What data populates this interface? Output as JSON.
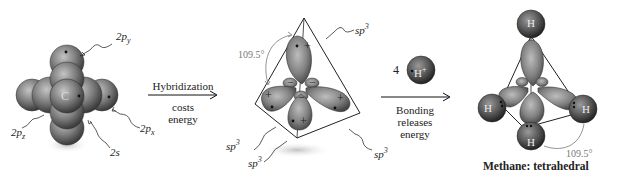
{
  "panels": {
    "carbon": {
      "atom_symbol": "C",
      "labels": {
        "p_y": {
          "base": "2p",
          "sub": "y"
        },
        "p_x": {
          "base": "2p",
          "sub": "x"
        },
        "p_z": {
          "base": "2p",
          "sub": "z"
        },
        "s": "2s"
      }
    },
    "arrow1": {
      "top": "Hybridization",
      "bottom_line1": "costs",
      "bottom_line2": "energy"
    },
    "hybrid": {
      "angle": "109.5°",
      "orbital_label_base": "sp",
      "orbital_label_sup": "3",
      "signs": {
        "plus": "+",
        "minus": "−"
      }
    },
    "hydrogen": {
      "count": "4",
      "symbol": "H",
      "charge": "+"
    },
    "arrow2": {
      "bottom_line1": "Bonding",
      "bottom_line2": "releases",
      "bottom_line3": "energy"
    },
    "methane": {
      "atom_symbol": "H",
      "angle": "109.5°",
      "caption": "Methane: tetrahedral"
    }
  },
  "colors": {
    "orbital_dark": "#3a3a3a",
    "orbital_mid": "#8a8a8a",
    "orbital_light": "#c8c8c8",
    "line": "#222222",
    "angle_text": "#777777"
  }
}
